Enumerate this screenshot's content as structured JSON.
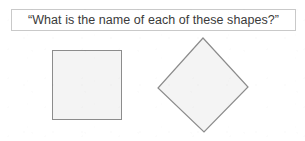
{
  "page": {
    "background_color": "#ffffff",
    "width": 305,
    "height": 141
  },
  "prompt": {
    "text": "“What is the name of each of these shapes?”",
    "border_color": "#c9c9c9",
    "text_color": "#3a3a3a"
  },
  "shapes": [
    {
      "name": "square",
      "kind": "square",
      "fill_color": "#f4f4f4",
      "stroke_color": "#8c8c8c",
      "position": {
        "x": 52,
        "y": 50
      },
      "size": {
        "width": 70,
        "height": 70
      },
      "rotation_degrees": 0
    },
    {
      "name": "diamond",
      "kind": "square-rotated",
      "fill_color": "#f4f4f4",
      "stroke_color": "#8c8c8c",
      "vertices": [
        {
          "x": 203,
          "y": 37
        },
        {
          "x": 249,
          "y": 87
        },
        {
          "x": 204,
          "y": 133
        },
        {
          "x": 158,
          "y": 88
        }
      ],
      "rotation_degrees": 45
    }
  ]
}
